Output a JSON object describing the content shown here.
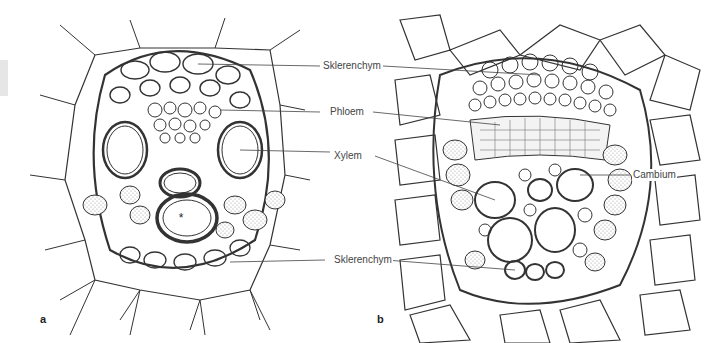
{
  "figure": {
    "panels": [
      {
        "id": "a",
        "letter": "a"
      },
      {
        "id": "b",
        "letter": "b"
      }
    ],
    "labels": {
      "sklerenchym_top": "Sklerenchym",
      "phloem": "Phloem",
      "xylem": "Xylem",
      "cambium": "Cambium",
      "sklerenchym_bottom": "Sklerenchym"
    },
    "markers": {
      "asterisk": "*"
    },
    "colors": {
      "line": "#333333",
      "stipple": "#9a9a9a",
      "label_text": "#444444",
      "background": "#ffffff"
    }
  }
}
